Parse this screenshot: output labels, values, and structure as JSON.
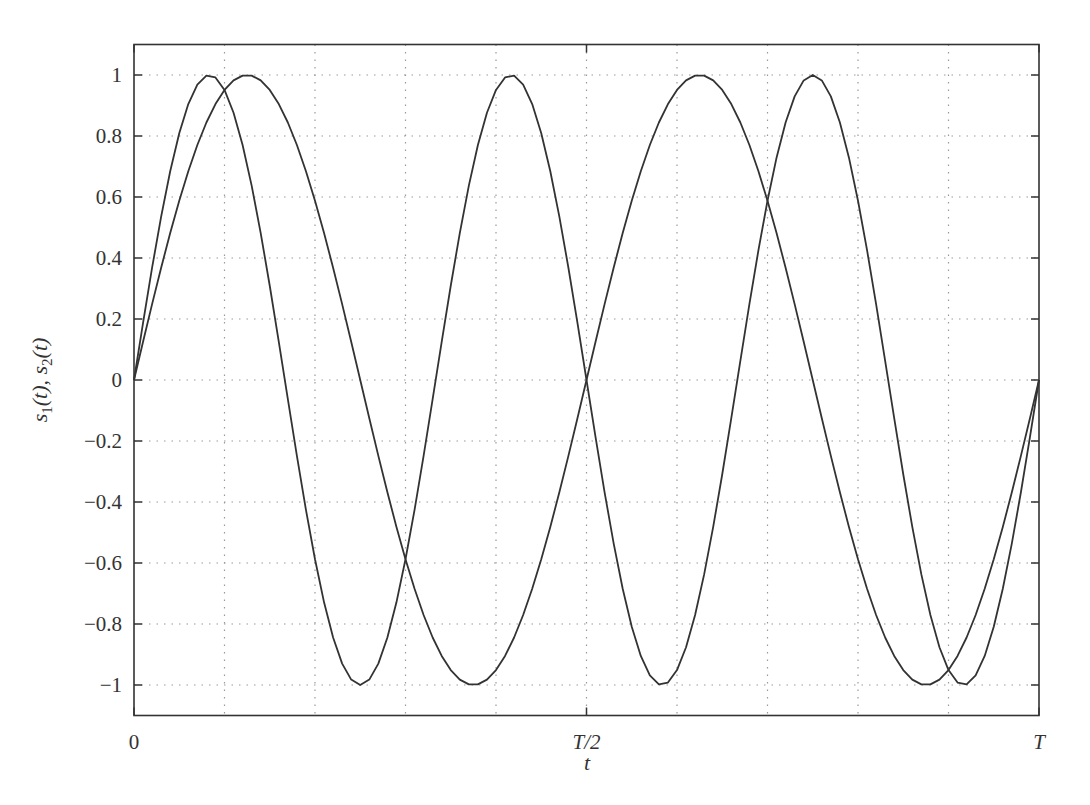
{
  "chart_data": {
    "type": "line",
    "title": "",
    "xlabel": "t",
    "ylabel": "s1(t), s2(t)",
    "ylabel_parts": {
      "s1": "s",
      "sub1": "1",
      "mid": "(t), ",
      "s2": "s",
      "sub2": "2",
      "end": "(t)"
    },
    "xlim": [
      0,
      1
    ],
    "ylim": [
      -1.1,
      1.1
    ],
    "grid": true,
    "x_ticks": [
      {
        "value": 0,
        "label": "0"
      },
      {
        "value": 0.5,
        "label": "T/2"
      },
      {
        "value": 1,
        "label": "T"
      }
    ],
    "x_grid": [
      0.1,
      0.2,
      0.3,
      0.4,
      0.5,
      0.6,
      0.7,
      0.8,
      0.9
    ],
    "y_ticks": [
      {
        "value": 1,
        "label": "1"
      },
      {
        "value": 0.8,
        "label": "0.8"
      },
      {
        "value": 0.6,
        "label": "0.6"
      },
      {
        "value": 0.4,
        "label": "0.4"
      },
      {
        "value": 0.2,
        "label": "0.2"
      },
      {
        "value": 0,
        "label": "0"
      },
      {
        "value": -0.2,
        "label": "-0.2"
      },
      {
        "value": -0.4,
        "label": "-0.4"
      },
      {
        "value": -0.6,
        "label": "-0.6"
      },
      {
        "value": -0.8,
        "label": "-0.8"
      },
      {
        "value": -1,
        "label": "-1"
      }
    ],
    "series": [
      {
        "name": "s1(t)",
        "formula": "sin(2*pi*3*t/T)",
        "cycles": 3,
        "samples": 100,
        "color": "#333333"
      },
      {
        "name": "s2(t)",
        "formula": "sin(2*pi*2*t/T)",
        "cycles": 2,
        "samples": 100,
        "color": "#333333"
      }
    ],
    "legend": null
  },
  "style": {
    "line_color": "#333333",
    "grid_color": "#9a9a9a",
    "axis_color": "#333333"
  }
}
